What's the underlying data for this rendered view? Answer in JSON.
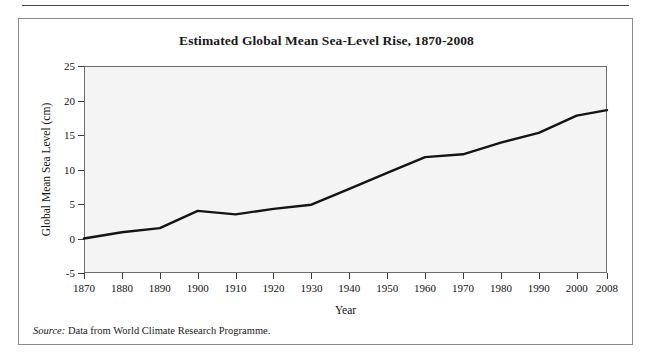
{
  "figure": {
    "title": "Estimated Global Mean Sea-Level Rise, 1870-2008",
    "source_label": "Source:",
    "source_text": " Data from World Climate Research Programme."
  },
  "chart_data": {
    "type": "line",
    "title": "Estimated Global Mean Sea-Level Rise, 1870-2008",
    "xlabel": "Year",
    "ylabel": "Global Mean Sea Level (cm)",
    "xlim": [
      1870,
      2008
    ],
    "ylim": [
      -5,
      25
    ],
    "grid": false,
    "legend": null,
    "x_ticks": [
      1870,
      1880,
      1890,
      1900,
      1910,
      1920,
      1930,
      1940,
      1950,
      1960,
      1970,
      1980,
      1990,
      2000,
      2008
    ],
    "x_tick_labels": [
      "1870",
      "1880",
      "1890",
      "1900",
      "1910",
      "1920",
      "1930",
      "1940",
      "1950",
      "1960",
      "1970",
      "1980",
      "1990",
      "2000",
      "2008"
    ],
    "y_ticks": [
      -5,
      0,
      5,
      10,
      15,
      20,
      25
    ],
    "y_tick_labels": [
      "-5",
      "0",
      "5",
      "10",
      "15",
      "20",
      "25"
    ],
    "x": [
      1870,
      1880,
      1890,
      1900,
      1910,
      1920,
      1930,
      1940,
      1950,
      1960,
      1970,
      1980,
      1990,
      2000,
      2008
    ],
    "values": [
      0.0,
      0.9,
      1.5,
      4.0,
      3.5,
      4.3,
      4.9,
      7.2,
      9.5,
      11.8,
      12.2,
      13.9,
      15.3,
      17.8,
      18.6
    ],
    "series_name": "Global Mean Sea Level",
    "line_color": "#141414",
    "line_width": 2.4,
    "plot_background": "#f4f4f4",
    "axis_color": "#6d6d6d"
  }
}
